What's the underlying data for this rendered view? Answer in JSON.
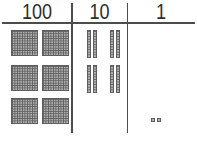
{
  "header": {
    "columns": [
      {
        "label": "100"
      },
      {
        "label": "10"
      },
      {
        "label": "1"
      }
    ]
  },
  "blocks": {
    "hundreds_flats": 6,
    "tens_rods": 8,
    "ones_cubes": 2
  },
  "chart_data": {
    "type": "table",
    "columns": [
      "100",
      "10",
      "1"
    ],
    "counts": [
      6,
      8,
      2
    ],
    "represented_value": 682
  },
  "colors": {
    "background": "#ffffff",
    "line": "#4c4c4c",
    "text": "#2e2e2e",
    "block_fill": "#b2b2b2",
    "block_grid": "#5f5f5f",
    "block_border": "#5e5e5e"
  }
}
